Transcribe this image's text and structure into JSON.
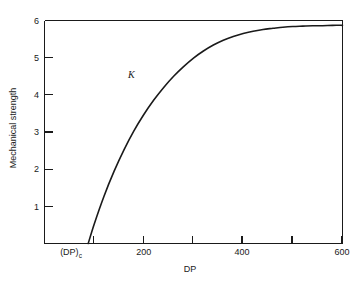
{
  "chart_data": {
    "type": "line",
    "title": "",
    "xlabel": "DP",
    "ylabel": "Mechanical strength",
    "xlim": [
      0,
      600
    ],
    "ylim": [
      0,
      6
    ],
    "grid": false,
    "legend": null,
    "x_tick_labels": [
      "(DP)c",
      "200",
      "400",
      "600"
    ],
    "x_tick_values": [
      100,
      200,
      400,
      600
    ],
    "x_tick_positions_all": [
      0,
      100,
      200,
      300,
      400,
      500,
      600
    ],
    "y_tick_labels": [
      "1",
      "2",
      "3",
      "4",
      "5",
      "6"
    ],
    "y_tick_values": [
      1,
      2,
      3,
      4,
      5,
      6
    ],
    "series": [
      {
        "name": "mechanical strength vs DP",
        "color": "#1a1a1a",
        "x": [
          88,
          100,
          120,
          140,
          160,
          180,
          200,
          220,
          240,
          260,
          280,
          300,
          320,
          340,
          360,
          380,
          400,
          420,
          440,
          460,
          480,
          500,
          520,
          540,
          560,
          580,
          600
        ],
        "y": [
          0.0,
          0.52,
          1.28,
          1.94,
          2.52,
          3.03,
          3.47,
          3.86,
          4.2,
          4.5,
          4.76,
          4.99,
          5.18,
          5.34,
          5.47,
          5.57,
          5.65,
          5.71,
          5.76,
          5.79,
          5.82,
          5.84,
          5.85,
          5.86,
          5.86,
          5.87,
          5.87
        ]
      }
    ],
    "annotations": [
      {
        "text": "K",
        "x": 175,
        "y": 4.45,
        "style": "italic-serif",
        "name": "k-annotation"
      }
    ]
  },
  "axis": {
    "x_label": "DP",
    "y_label": "Mechanical strength",
    "x_tick_dp_c_base": "(DP)",
    "x_tick_dp_c_sub": "c",
    "x_tick_200": "200",
    "x_tick_400": "400",
    "x_tick_600": "600",
    "y_tick_1": "1",
    "y_tick_2": "2",
    "y_tick_3": "3",
    "y_tick_4": "4",
    "y_tick_5": "5",
    "y_tick_6": "6"
  },
  "colors": {
    "background": "#ffffff",
    "axis": "#1a1a1a",
    "curve": "#1a1a1a",
    "text": "#1a1a1a"
  }
}
